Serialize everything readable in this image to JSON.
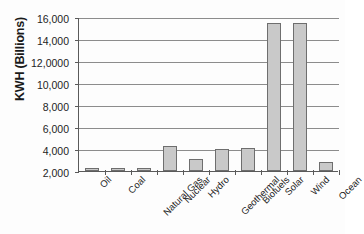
{
  "chart_data": {
    "type": "bar",
    "title": "",
    "xlabel": "",
    "ylabel": "KWH (Billions)",
    "categories": [
      "Oil",
      "Coal",
      "Natural Gas",
      "Nuclear",
      "Hydro",
      "Geothermal",
      "Biofuels",
      "Solar",
      "Wind",
      "Ocean"
    ],
    "values": [
      2300,
      2300,
      2300,
      4300,
      3100,
      4000,
      4100,
      15450,
      15450,
      2800
    ],
    "ylim": [
      2000,
      16000
    ],
    "ytick_labels": [
      "16,000",
      "14,000",
      "12,0000",
      "10,000",
      "8,000",
      "6,000",
      "4,000",
      "2,000"
    ],
    "ytick_values": [
      16000,
      14000,
      12000,
      10000,
      8000,
      6000,
      4000,
      2000
    ],
    "grid": true,
    "legend": "none",
    "series": [
      {
        "name": "KWH (Billions)",
        "values": [
          2300,
          2300,
          2300,
          4300,
          3100,
          4000,
          4100,
          15450,
          15450,
          2800
        ]
      }
    ],
    "bar_fill_color": "#c9c9c9",
    "bar_border_color": "#6e6e6e",
    "gridline_color": "#8c8c8c",
    "axis_color": "#5a5a5a"
  }
}
